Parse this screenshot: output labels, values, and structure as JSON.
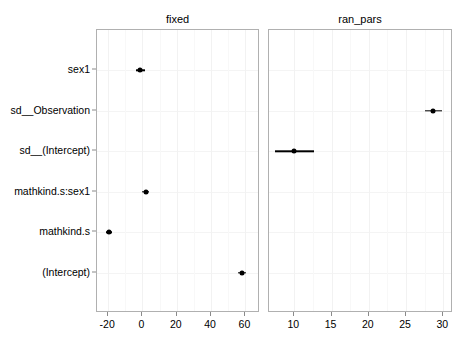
{
  "chart_data": {
    "type": "scatter",
    "title": "",
    "xlabel": "",
    "ylabel": "",
    "grid": true,
    "legend": "none",
    "orientation": "horizontal",
    "facet_var": "effect",
    "facets": [
      {
        "name": "fixed",
        "label": "fixed",
        "xlim": [
          -26.5,
          68.5
        ],
        "xticks": [
          -20,
          0,
          20,
          40,
          60
        ],
        "xticklabels": [
          "-20",
          "0",
          "20",
          "40",
          "60"
        ]
      },
      {
        "name": "ran_pars",
        "label": "ran_pars",
        "xlim": [
          6.6,
          31.3
        ],
        "xticks": [
          10,
          15,
          20,
          25,
          30
        ],
        "xticklabels": [
          "10",
          "15",
          "20",
          "25",
          "30"
        ]
      }
    ],
    "categories": [
      "sex1",
      "sd__Observation",
      "sd__(Intercept)",
      "mathkind.s:sex1",
      "mathkind.s",
      "(Intercept)"
    ],
    "points": [
      {
        "term": "sex1",
        "facet": "fixed",
        "estimate": -1.2,
        "conf_low": -4.0,
        "conf_high": 1.6
      },
      {
        "term": "sd__Observation",
        "facet": "ran_pars",
        "estimate": 28.6,
        "conf_low": 27.5,
        "conf_high": 29.8
      },
      {
        "term": "sd__(Intercept)",
        "facet": "ran_pars",
        "estimate": 10.0,
        "conf_low": 7.4,
        "conf_high": 12.6
      },
      {
        "term": "mathkind.s:sex1",
        "facet": "fixed",
        "estimate": 2.0,
        "conf_low": -0.1,
        "conf_high": 4.1
      },
      {
        "term": "mathkind.s",
        "facet": "fixed",
        "estimate": -19.5,
        "conf_low": -21.3,
        "conf_high": -17.8
      },
      {
        "term": "(Intercept)",
        "facet": "fixed",
        "estimate": 58.0,
        "conf_low": 55.9,
        "conf_high": 60.4
      }
    ]
  },
  "colors": {
    "point": "#000000",
    "errorbar": "#000000",
    "panel_border": "#b0b0b0",
    "gridline": "#f2f2f2",
    "background": "#ffffff",
    "text": "#000000"
  }
}
